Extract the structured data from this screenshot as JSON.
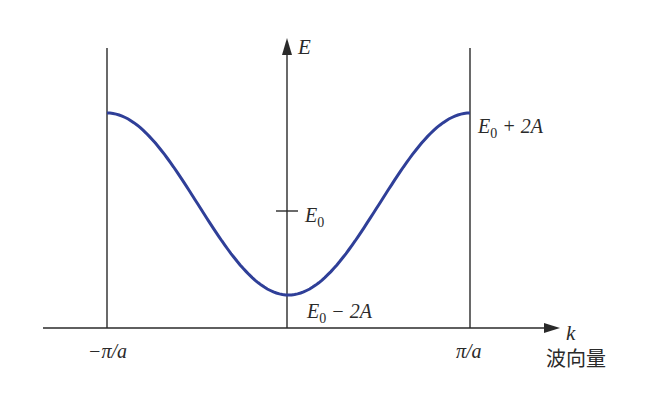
{
  "chart_data": {
    "type": "line",
    "title": "",
    "xlabel": "k",
    "xlabel_caption": "波向量",
    "ylabel": "E",
    "x_ticks": [
      "−π/a",
      "π/a"
    ],
    "y_ticks": [
      "E₀"
    ],
    "annotations": [
      "E₀ + 2A",
      "E₀ − 2A"
    ],
    "series": [
      {
        "name": "E(k) = E₀ − 2A cos(ka)",
        "color": "#2f3f98",
        "x": [
          "−π/a",
          "−π/2a",
          "0",
          "π/2a",
          "π/a"
        ],
        "values": [
          "E₀ + 2A",
          "E₀",
          "E₀ − 2A",
          "E₀",
          "E₀ + 2A"
        ]
      }
    ],
    "grid": false,
    "legend": "none"
  },
  "labels": {
    "y_axis": "E",
    "x_axis": "k",
    "x_caption": "波向量",
    "e0": "E",
    "e0_sub": "0",
    "top_E": "E",
    "top_sub": "0",
    "top_rest": " + 2A",
    "bot_E": "E",
    "bot_sub": "0",
    "bot_rest": " − 2A",
    "left_tick": "−π/a",
    "right_tick": "π/a"
  },
  "colors": {
    "curve": "#2f3f98",
    "axis": "#2a2a2a"
  }
}
